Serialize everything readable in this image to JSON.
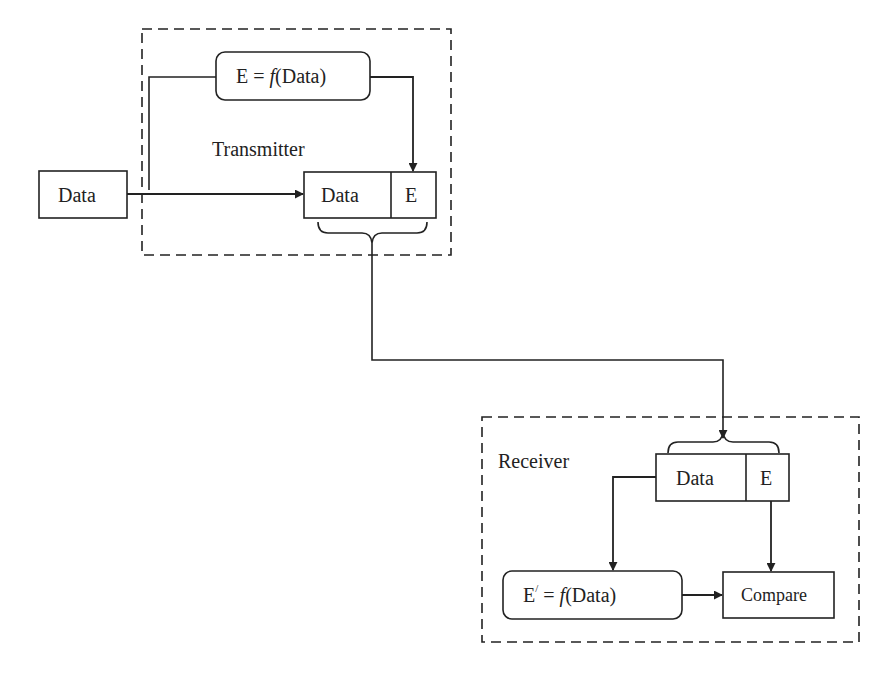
{
  "diagram": {
    "transmitter": {
      "label": "Transmitter",
      "source_box": {
        "label": "Data"
      },
      "function_box": {
        "prefix": "E = ",
        "func": "f",
        "arg": "(Data)"
      },
      "packet": {
        "data_label": "Data",
        "check_label": "E"
      }
    },
    "receiver": {
      "label": "Receiver",
      "packet": {
        "data_label": "Data",
        "check_label": "E"
      },
      "function_box": {
        "prefix": "E",
        "prime": "/",
        "eq": " = ",
        "func": "f",
        "arg": "(Data)"
      },
      "compare_box": {
        "label": "Compare"
      }
    },
    "colors": {
      "line": "#222222",
      "background": "#ffffff"
    }
  }
}
